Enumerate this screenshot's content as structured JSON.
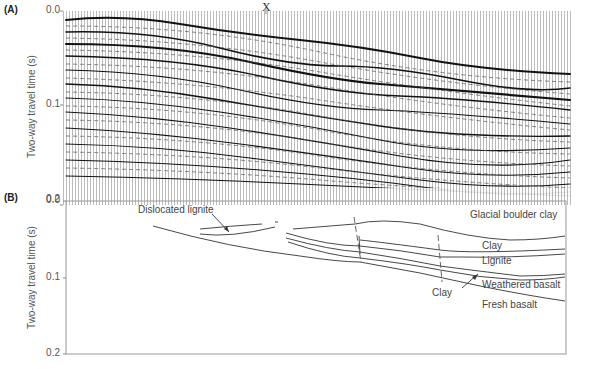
{
  "figure": {
    "marker_label": "X",
    "panel_a": {
      "label": "(A)",
      "y_axis_label": "Two-way travel time (s)",
      "y_ticks": [
        "0.0",
        "0.1",
        "0.2"
      ]
    },
    "panel_b": {
      "label": "(B)",
      "y_axis_label": "Two-way travel time (s)",
      "y_ticks": [
        "0.0",
        "0.1",
        "0.2"
      ],
      "annotations": {
        "dislocated_lignite": "Dislocated lignite",
        "clay_arrow": "Clay"
      },
      "layers": [
        "Glacial boulder clay",
        "Clay",
        "Lignite",
        "Weathered basalt",
        "Fresh basalt"
      ]
    }
  },
  "colors": {
    "line": "#333333",
    "frame": "#999999",
    "seismic_dark": "#111111",
    "seismic_light": "#bbbbbb"
  }
}
